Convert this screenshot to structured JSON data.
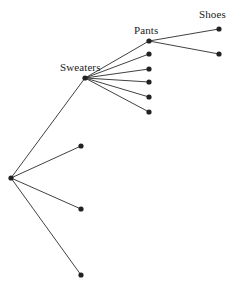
{
  "diagram": {
    "type": "tree",
    "title": "",
    "background_color": "#ffffff",
    "edge_color": "#2b2b2b",
    "node_color": "#222222",
    "node_radius": 2.6,
    "canvas": {
      "width": 247,
      "height": 293
    },
    "labels": [
      {
        "id": "label-sweaters",
        "text": "Sweaters",
        "x": 60,
        "y": 61,
        "anchor_node": "sweaters-hub"
      },
      {
        "id": "label-pants",
        "text": "Pants",
        "x": 134,
        "y": 24,
        "anchor_node": "pants-node"
      },
      {
        "id": "label-shoes",
        "text": "Shoes",
        "x": 199,
        "y": 8,
        "anchor_node": "shoes-node"
      }
    ],
    "nodes": [
      {
        "id": "root-hub",
        "name": "root-hub",
        "x": 11,
        "y": 178,
        "label": ""
      },
      {
        "id": "sweaters-hub",
        "name": "sweaters-hub",
        "x": 85,
        "y": 78,
        "label": "Sweaters"
      },
      {
        "id": "pants-node",
        "name": "pants-node",
        "x": 149,
        "y": 41,
        "label": "Pants"
      },
      {
        "id": "shoes-node",
        "name": "shoes-node",
        "x": 219,
        "y": 29,
        "label": "Shoes"
      },
      {
        "id": "shoes-sibling",
        "name": "shoes-sibling-leaf",
        "x": 219,
        "y": 54,
        "label": ""
      },
      {
        "id": "sweaters-leaf-1",
        "name": "sweaters-leaf",
        "x": 149,
        "y": 54,
        "label": ""
      },
      {
        "id": "sweaters-leaf-2",
        "name": "sweaters-leaf",
        "x": 149,
        "y": 69,
        "label": ""
      },
      {
        "id": "sweaters-leaf-3",
        "name": "sweaters-leaf",
        "x": 149,
        "y": 82,
        "label": ""
      },
      {
        "id": "sweaters-leaf-4",
        "name": "sweaters-leaf",
        "x": 149,
        "y": 97,
        "label": ""
      },
      {
        "id": "sweaters-leaf-5",
        "name": "sweaters-leaf",
        "x": 149,
        "y": 112,
        "label": ""
      },
      {
        "id": "root-leaf-1",
        "name": "root-leaf",
        "x": 81,
        "y": 146,
        "label": ""
      },
      {
        "id": "root-leaf-2",
        "name": "root-leaf",
        "x": 81,
        "y": 209,
        "label": ""
      },
      {
        "id": "root-leaf-3",
        "name": "root-leaf",
        "x": 81,
        "y": 275,
        "label": ""
      }
    ],
    "edges": [
      {
        "id": "edge-root-sweaters",
        "from": "root-hub",
        "to": "sweaters-hub"
      },
      {
        "id": "edge-root-leaf1",
        "from": "root-hub",
        "to": "root-leaf-1"
      },
      {
        "id": "edge-root-leaf2",
        "from": "root-hub",
        "to": "root-leaf-2"
      },
      {
        "id": "edge-root-leaf3",
        "from": "root-hub",
        "to": "root-leaf-3"
      },
      {
        "id": "edge-sweaters-pants",
        "from": "sweaters-hub",
        "to": "pants-node"
      },
      {
        "id": "edge-sweaters-l1",
        "from": "sweaters-hub",
        "to": "sweaters-leaf-1"
      },
      {
        "id": "edge-sweaters-l2",
        "from": "sweaters-hub",
        "to": "sweaters-leaf-2"
      },
      {
        "id": "edge-sweaters-l3",
        "from": "sweaters-hub",
        "to": "sweaters-leaf-3"
      },
      {
        "id": "edge-sweaters-l4",
        "from": "sweaters-hub",
        "to": "sweaters-leaf-4"
      },
      {
        "id": "edge-sweaters-l5",
        "from": "sweaters-hub",
        "to": "sweaters-leaf-5"
      },
      {
        "id": "edge-pants-shoes",
        "from": "pants-node",
        "to": "shoes-node"
      },
      {
        "id": "edge-pants-sibling",
        "from": "pants-node",
        "to": "shoes-sibling"
      }
    ]
  }
}
